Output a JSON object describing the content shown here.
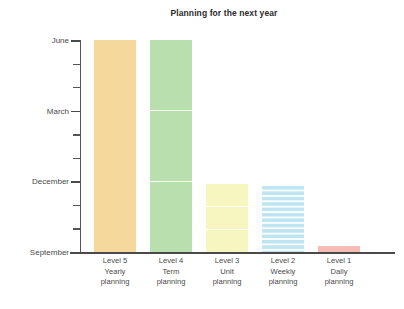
{
  "chart_data": {
    "type": "bar",
    "title": "Planning for the next year",
    "xlabel": "",
    "ylabel": "",
    "grid": false,
    "legend": null,
    "categories": [
      "Level 5\nYearly\nplanning",
      "Level 4\nTerm\nplanning",
      "Level 3\nUnit\nplanning",
      "Level 2\nWeekly\nplanning",
      "Level 1\nDaily\nplanning"
    ],
    "y_axis": {
      "tick_labels": [
        "September",
        "December",
        "March",
        "June"
      ],
      "ticks_major_values": [
        0,
        3,
        6,
        9
      ],
      "minor_ticks_values": [
        1,
        2,
        4,
        5,
        7,
        8
      ],
      "range": [
        0,
        9
      ],
      "unit": "months"
    },
    "series": [
      {
        "name": "Planning horizon",
        "values": [
          9,
          9,
          2.9,
          2.8,
          0.25
        ]
      }
    ],
    "bars": [
      {
        "category_label": "Level 5",
        "category_detail": "Yearly",
        "category_detail2": "planning",
        "value": 9,
        "top_label": "June",
        "segments": 1,
        "color": "#f5d89c",
        "pattern": "solid"
      },
      {
        "category_label": "Level 4",
        "category_detail": "Term",
        "category_detail2": "planning",
        "value": 9,
        "top_label": "June",
        "segments": 3,
        "color": "#b9dfae",
        "pattern": "segmented"
      },
      {
        "category_label": "Level 3",
        "category_detail": "Unit",
        "category_detail2": "planning",
        "value": 2.9,
        "top_label": "December",
        "segments": 3,
        "color": "#f7f5c0",
        "pattern": "segmented"
      },
      {
        "category_label": "Level 2",
        "category_detail": "Weekly",
        "category_detail2": "planning",
        "value": 2.8,
        "top_label": "December",
        "segments": 12,
        "color": "#bfe4f2",
        "pattern": "striped"
      },
      {
        "category_label": "Level 1",
        "category_detail": "Daily",
        "category_detail2": "planning",
        "value": 0.25,
        "top_label": "September",
        "segments": 1,
        "color": "#f5bcb4",
        "pattern": "solid"
      }
    ],
    "colors": {
      "axis": "#4a4a4a",
      "text": "#3a3a3a",
      "background": "#ffffff",
      "bar_yearly": "#f5d89c",
      "bar_term": "#b9dfae",
      "bar_unit": "#f7f5c0",
      "bar_weekly": "#bfe4f2",
      "bar_daily": "#f5bcb4",
      "segment_divider": "#ffffff"
    }
  },
  "axis_labels": {
    "y0": "September",
    "y1": "December",
    "y2": "March",
    "y3": "June"
  }
}
